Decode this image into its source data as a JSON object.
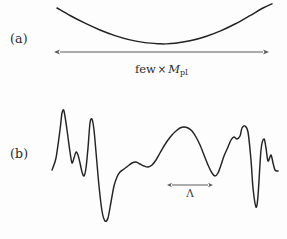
{
  "figure": {
    "background_color": "#fdfdfd",
    "curve_color": "#232323",
    "arrow_color": "#5a5a5a"
  },
  "panels": [
    {
      "id": "a",
      "label": "(a)",
      "description": "Smooth convex (parabolic) potential",
      "scale_caption": {
        "prefix": "few",
        "times": "×",
        "symbol": "M",
        "subscript": "pl",
        "full_text": "few × Mpl"
      }
    },
    {
      "id": "b",
      "label": "(b)",
      "description": "Rugged random potential with short correlation length",
      "scale_caption": {
        "symbol": "Λ",
        "full_text": "Λ"
      }
    }
  ],
  "chart_data": {
    "type": "line",
    "xlabel": "",
    "ylabel": "",
    "grid": false,
    "legend": false,
    "xlim": [
      0,
      287
    ],
    "ylim": [
      239,
      0
    ],
    "series": [
      {
        "name": "panel-a-parabola",
        "panel": "a",
        "comment": "Convex parabola, minimum near x=165",
        "x": [
          57,
          70,
          85,
          100,
          115,
          130,
          145,
          160,
          165,
          175,
          190,
          205,
          220,
          235,
          250,
          262,
          272
        ],
        "y": [
          8,
          15.5,
          23.2,
          30.0,
          35.6,
          39.9,
          42.6,
          43.8,
          43.9,
          43.3,
          40.8,
          36.7,
          31.1,
          24.0,
          15.6,
          8.5,
          3.8
        ]
      },
      {
        "name": "panel-a-scale-arrow",
        "panel": "a",
        "comment": "Double-headed horizontal arrow spanning the parabola width",
        "x_start": 60,
        "x_end": 263,
        "y": 52,
        "label": "few × Mpl",
        "double_headed": true
      },
      {
        "name": "panel-b-rugged-potential",
        "panel": "b",
        "comment": "Jagged random potential traced from the screenshot",
        "x": [
          52,
          56,
          60,
          62,
          64,
          67,
          70,
          72,
          74,
          76,
          78,
          80,
          82,
          84,
          86,
          88,
          90,
          92,
          94,
          96,
          99,
          102,
          105,
          108,
          111,
          114,
          117,
          120,
          124,
          128,
          132,
          136,
          140,
          144,
          148,
          152,
          156,
          160,
          164,
          168,
          172,
          176,
          180,
          184,
          188,
          192,
          196,
          200,
          204,
          208,
          212,
          215,
          218,
          221,
          224,
          228,
          231,
          234,
          237,
          240,
          242,
          245,
          248,
          251,
          253,
          256,
          258,
          261,
          264,
          266,
          268,
          271,
          273,
          275,
          278
        ],
        "y": [
          170,
          158,
          130,
          113,
          111,
          130,
          152,
          163,
          158,
          152,
          155,
          163,
          172,
          176,
          168,
          148,
          123,
          119,
          130,
          152,
          186,
          211,
          221,
          218,
          202,
          186,
          177,
          172,
          169,
          166,
          163,
          162,
          164,
          166,
          167,
          165,
          160,
          153,
          146,
          140,
          135,
          131,
          128,
          127,
          128,
          131,
          137,
          145,
          155,
          165,
          173,
          176,
          173,
          165,
          156,
          147,
          140,
          137,
          139,
          136,
          128,
          126,
          132,
          160,
          188,
          207,
          196,
          150,
          139,
          148,
          161,
          155,
          163,
          170,
          171
        ]
      },
      {
        "name": "panel-b-lambda-arrow",
        "panel": "b",
        "comment": "Short double-headed arrow indicating the correlation length Lambda",
        "x_start": 172,
        "x_end": 208,
        "y": 185,
        "label": "Λ",
        "double_headed": true
      }
    ]
  }
}
